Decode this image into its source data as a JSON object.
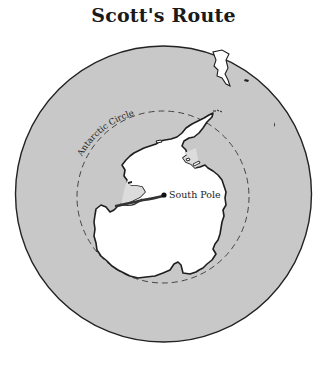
{
  "title": "Scott's Route",
  "map": {
    "projection": "south-polar",
    "labels": {
      "antarctic_circle": "Antarctic Circle",
      "south_pole": "South Pole"
    },
    "colors": {
      "ocean": "#c8c8c8",
      "land": "#ffffff",
      "ice_shelf": "#dcdcdc",
      "coastline": "#1e1e1e",
      "route": "#333333",
      "circle_border": "#222222"
    },
    "features": [
      "outer-globe-circle",
      "antarctic-circle-dashed",
      "antarctica-landmass",
      "ross-ice-shelf",
      "weddell-ice-shelf",
      "south-america-tip",
      "scott-route",
      "south-pole-marker"
    ]
  }
}
